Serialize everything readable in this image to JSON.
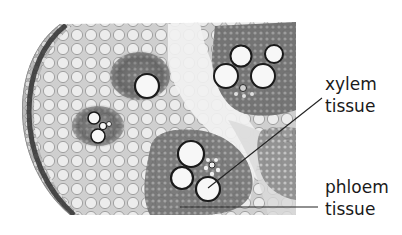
{
  "figure": {
    "colors": {
      "background": "#ffffff",
      "parenchyma_fill": "#e6e6e6",
      "cell_wall": "#8a8a8a",
      "epidermis_dark": "#3a3a3a",
      "bundle_tissue": "#6e6e6e",
      "vessel_fill": "#f7f7f7",
      "vessel_wall": "#1a1a1a",
      "label_text": "#1a1a1a",
      "leader_line": "#222222"
    },
    "labels": [
      {
        "id": "xylem",
        "line1": "xylem",
        "line2": "tissue",
        "leader": {
          "x1": 322,
          "y1": 98,
          "x2": 208,
          "y2": 188
        }
      },
      {
        "id": "phloem",
        "line1": "phloem",
        "line2": "tissue",
        "leader": {
          "x1": 180,
          "y1": 207,
          "x2": 318,
          "y2": 207
        }
      }
    ]
  }
}
